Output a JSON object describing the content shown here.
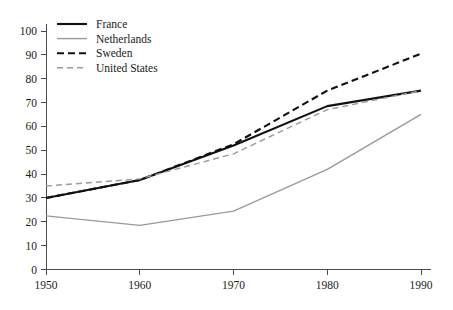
{
  "chart_data": {
    "type": "line",
    "title": "",
    "subtitle": "",
    "xlabel": "",
    "ylabel": "",
    "x": [
      1950,
      1960,
      1970,
      1980,
      1990
    ],
    "xticklabels": [
      "1950",
      "1960",
      "1970",
      "1980",
      "1990"
    ],
    "xlim": [
      1950,
      1990
    ],
    "ylim": [
      0,
      100
    ],
    "yticks": [
      0,
      10,
      20,
      30,
      40,
      50,
      60,
      70,
      80,
      90,
      100
    ],
    "yticklabels": [
      "0",
      "10",
      "20",
      "30",
      "40",
      "50",
      "60",
      "70",
      "80",
      "90",
      "100"
    ],
    "grid": false,
    "legend_position": "top-left",
    "series": [
      {
        "name": "France",
        "values": [
          30,
          37.5,
          52,
          68.5,
          75
        ],
        "color": "#111111",
        "style": "solid",
        "width": 2.1
      },
      {
        "name": "Netherlands",
        "values": [
          22.5,
          18.5,
          24.5,
          42,
          65
        ],
        "color": "#9a9a9a",
        "style": "solid",
        "width": 1.4
      },
      {
        "name": "Sweden",
        "values": [
          30,
          37.5,
          52.5,
          75,
          90.5
        ],
        "color": "#111111",
        "style": "dashed",
        "width": 2.1
      },
      {
        "name": "United States",
        "values": [
          35,
          38,
          48.5,
          67,
          75
        ],
        "color": "#9a9a9a",
        "style": "dashed",
        "width": 1.4
      }
    ]
  },
  "legend": {
    "entries": [
      {
        "label": "France"
      },
      {
        "label": "Netherlands"
      },
      {
        "label": "Sweden"
      },
      {
        "label": "United States"
      }
    ]
  },
  "colors": {
    "axis": "#4a4a4a",
    "text": "#1a1a1a",
    "dark_series": "#111111",
    "light_series": "#9a9a9a",
    "background": "#ffffff"
  }
}
